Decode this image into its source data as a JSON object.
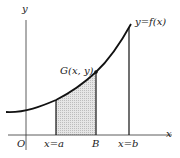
{
  "diagram": {
    "type": "area-under-curve",
    "labels": {
      "y_axis": "y",
      "x_axis": "x",
      "origin": "O",
      "curve": "y=f(x)",
      "point": "G(x, y)",
      "left_bound": "x=a",
      "moving_bound": "B",
      "right_bound": "x=b"
    },
    "colors": {
      "stroke": "#111111",
      "shade": "#d9d9d9",
      "text": "#1a1a1a"
    }
  }
}
